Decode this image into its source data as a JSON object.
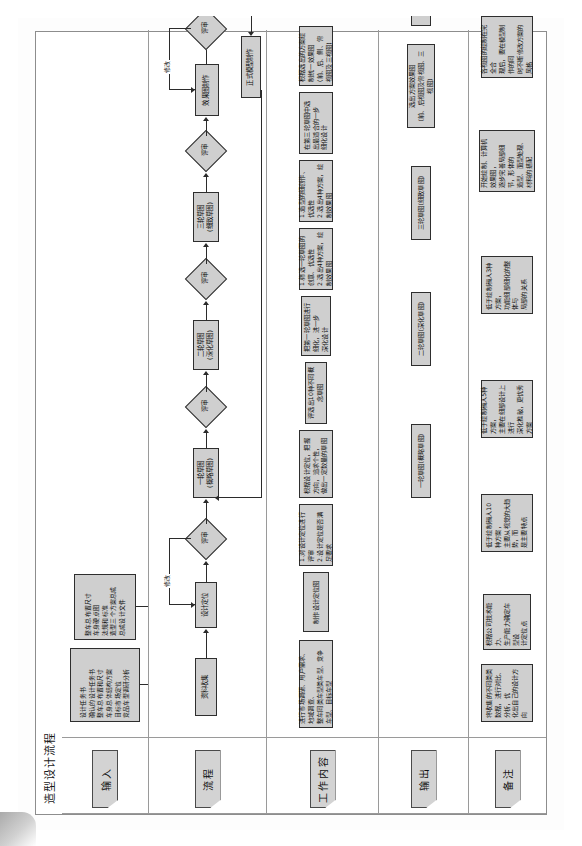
{
  "document": {
    "title": "造型设计流程"
  },
  "columns": [
    {
      "key": "input",
      "label": "输入"
    },
    {
      "key": "process",
      "label": "流程"
    },
    {
      "key": "work",
      "label": "工作内容"
    },
    {
      "key": "output",
      "label": "输出"
    },
    {
      "key": "remark",
      "label": "备注"
    }
  ],
  "edge_labels": {
    "revise_1": "修改",
    "revise_2": "修改"
  },
  "input_nodes": [
    {
      "id": "in-1",
      "text": "设计任务书\n确认的设计任务书\n整车总布置和尺寸\n车身总体结构方案\n目标市场定位\n竞品车型调研分析"
    },
    {
      "id": "in-2",
      "text": "整车总布置尺寸\n车身硬点图\n法规和标准\n造型三个方案总成\n总成设计文件"
    }
  ],
  "process_nodes": [
    {
      "id": "p-1",
      "shape": "box",
      "text": "资料收集"
    },
    {
      "id": "p-2",
      "shape": "box",
      "text": "设计定位"
    },
    {
      "id": "p-3",
      "shape": "diamond",
      "text": "评审"
    },
    {
      "id": "p-4",
      "shape": "box",
      "text": "一轮草图\n(概略草图)"
    },
    {
      "id": "p-5",
      "shape": "diamond",
      "text": "评审"
    },
    {
      "id": "p-6",
      "shape": "box",
      "text": "二轮草图\n(深化草图)"
    },
    {
      "id": "p-7",
      "shape": "diamond",
      "text": "评审"
    },
    {
      "id": "p-8",
      "shape": "box",
      "text": "三轮草图\n(细致草图)"
    },
    {
      "id": "p-9",
      "shape": "diamond",
      "text": "评审"
    },
    {
      "id": "p-10",
      "shape": "box",
      "text": "效果图制作"
    },
    {
      "id": "p-11",
      "shape": "diamond",
      "text": "评审"
    },
    {
      "id": "p-12",
      "shape": "box",
      "text": "正式模型制作"
    }
  ],
  "work_nodes": [
    {
      "id": "w-1",
      "text": "进行市场调研、用户需求、地域调查、\n整车同类车型类车型、竞争车型、目标车型"
    },
    {
      "id": "w-2",
      "text": "制作设计定位图"
    },
    {
      "id": "w-3",
      "text": "1.对设计定位进行评审\n2.设计定位是否满足要求"
    },
    {
      "id": "w-4",
      "text": "根据设计定位，把握方向，追求个性，\n做出一定数量的草图"
    },
    {
      "id": "w-5",
      "text": "评选出10种不同概念草图"
    },
    {
      "id": "w-6",
      "text": "把第一轮草图进行细化，进一步\n深化设计"
    },
    {
      "id": "w-7",
      "text": "1.筛选一轮草图的创意、优选性\n2.选出4种方案，绘制效果图"
    },
    {
      "id": "w-8",
      "text": "1.造型的细创作、优选性\n2.选出4种方案，绘制效果图"
    },
    {
      "id": "w-9",
      "text": "在第三轮草图中选出最适合的一步\n细化设计"
    },
    {
      "id": "w-10",
      "text": "根据选出的方案绘制统一效果图\n(前、后、侧、俯视图及三视图)"
    },
    {
      "id": "w-11",
      "text": "1.整车与马路造型的统一性的评审\n2.造型效果评审\n3.色彩与内饰的评审\n4.选出二个方案进行三维建模"
    },
    {
      "id": "w-12",
      "text": "在选定的效果图制作三维模型基础上，制作\n实物化，带有机型曲面的正式模型或数字化油泥模型"
    }
  ],
  "output_nodes": [
    {
      "id": "o-1",
      "text": "一轮草图(概略草图)"
    },
    {
      "id": "o-2",
      "text": "二轮草图(深化草图)"
    },
    {
      "id": "o-3",
      "text": "三轮草图(细致草图)"
    },
    {
      "id": "o-4",
      "text": "选出方案效果图\n(前、后视图及俯视图、三视图)"
    },
    {
      "id": "o-5",
      "text": "正式模型"
    }
  ],
  "remark_nodes": [
    {
      "id": "r-1",
      "text": "将收集的不同类类数据，进行对比、分析，优\n化出自己的设计方向"
    },
    {
      "id": "r-2",
      "text": "根据公司技术能力、\n生产能力确定车型设\n计定位点"
    },
    {
      "id": "r-3",
      "text": "低于绘制稿人10种方案，\n主要从视觉的大趋势，而\n是主要特点"
    },
    {
      "id": "r-4",
      "text": "低于绘制稿人5种方案，\n主要在细部设计上进行\n深化推敲，更优秀方案"
    },
    {
      "id": "r-5",
      "text": "低于绘制稿人3种方案，\n功能细部细化的整体与\n局部的关系"
    },
    {
      "id": "r-6",
      "text": "开始绘制、计算机效果图，\n逐步完善局部细节，形体的\n造型、面型处理、材料的搭配"
    },
    {
      "id": "r-7",
      "text": "各视图的绘制在完全合\n理后，要在模型制作的同\n时不断修改方案的风格"
    }
  ]
}
